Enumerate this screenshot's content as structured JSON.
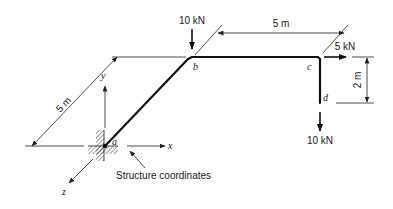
{
  "diagram": {
    "nodes": [
      {
        "id": "a",
        "label": "a"
      },
      {
        "id": "b",
        "label": "b"
      },
      {
        "id": "c",
        "label": "c"
      },
      {
        "id": "d",
        "label": "d"
      }
    ],
    "members": [
      {
        "from": "a",
        "to": "b"
      },
      {
        "from": "b",
        "to": "c"
      },
      {
        "from": "c",
        "to": "d"
      }
    ],
    "loads": [
      {
        "node": "b",
        "label": "10 kN",
        "direction": "down"
      },
      {
        "node": "c",
        "label": "5 kN",
        "direction": "+x"
      },
      {
        "node": "d",
        "label": "10 kN",
        "direction": "down"
      }
    ],
    "dimensions": [
      {
        "label": "5 m",
        "span": "a-b (along z)"
      },
      {
        "label": "5 m",
        "span": "b-c (along x)"
      },
      {
        "label": "2 m",
        "span": "c-d (along y)"
      }
    ],
    "axes": {
      "x": "x",
      "y": "y",
      "z": "z"
    },
    "annotation": "Structure coordinates",
    "support": "fixed support at a"
  }
}
